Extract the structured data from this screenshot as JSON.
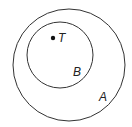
{
  "diagram": {
    "type": "venn",
    "circles": [
      {
        "id": "A",
        "label": "A",
        "cx": 69,
        "cy": 65,
        "r": 56
      },
      {
        "id": "B",
        "label": "B",
        "cx": 60,
        "cy": 55,
        "r": 33
      }
    ],
    "points": [
      {
        "id": "T",
        "label": "T",
        "x": 53,
        "y": 38
      }
    ],
    "stroke_color": "#333333"
  }
}
